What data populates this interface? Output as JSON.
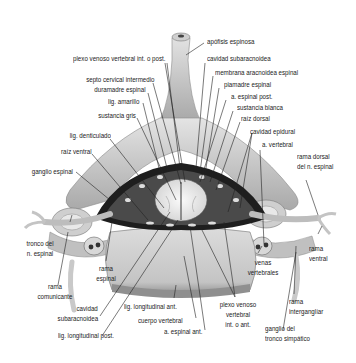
{
  "figure": {
    "colors": {
      "bone_light": "#d9d9d9",
      "bone_mid": "#b5b5b5",
      "bone_dark": "#7a7a7a",
      "cord": "#eeeeee",
      "dura": "#1e1e1e",
      "line": "#222222",
      "text": "#222222"
    },
    "labels": {
      "apofisis_espinosa": "apófisis espinosa",
      "plexo_venoso_post": "plexo venoso vertebral int. o post.",
      "cavidad_subaracnoidea_top": "cavidad subaracnoidea",
      "membrana_aracnoidea": "membrana aracnoidea espinal",
      "septo_cervical": "septo cervical intermedio",
      "piamadre": "piamadre espinal",
      "duramadre": "duramadre espinal",
      "a_espinal_post": "a. espinal post.",
      "lig_amarillo": "lig. amarillo",
      "sustancia_blanca": "sustancia blanca",
      "sustancia_gris": "sustancia gris",
      "raiz_dorsal": "raíz dorsal",
      "cavidad_epidural": "cavidad epidural",
      "lig_denticulado": "lig. denticulado",
      "a_vertebral": "a. vertebral",
      "raiz_ventral": "raíz ventral",
      "rama_dorsal_1": "rama dorsal",
      "rama_dorsal_2": "del n. espinal",
      "ganglio_espinal": "ganglio espinal",
      "tronco_1": "tronco del",
      "tronco_2": "n. espinal",
      "rama_espinal_1": "rama",
      "rama_espinal_2": "espinal",
      "venas_1": "venas",
      "venas_2": "vertebrales",
      "rama_ventral_1": "rama",
      "rama_ventral_2": "ventral",
      "rama_comunicante_1": "rama",
      "rama_comunicante_2": "comunicante",
      "rama_interg_1": "rama",
      "rama_interg_2": "interganglíar",
      "lig_long_ant": "lig. longitudinal ant.",
      "plexo_ant_1": "plexo venoso",
      "plexo_ant_2": "vertebral",
      "plexo_ant_3": "int. o ant.",
      "cavidad_sub_1": "cavidad",
      "cavidad_sub_2": "subaracnoidea",
      "cuerpo_vertebral": "cuerpo vertebral",
      "a_espinal_ant": "a. espinal ant.",
      "ganglio_simp_1": "ganglio del",
      "ganglio_simp_2": "tronco simpático",
      "lig_long_post": "lig. longitudinal post."
    }
  }
}
